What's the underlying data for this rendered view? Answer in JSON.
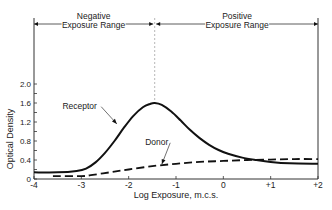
{
  "chart_data": {
    "type": "line",
    "title": "",
    "xlabel": "Log Exposure, m.c.s.",
    "ylabel": "Optical Density",
    "xlim": [
      -4,
      2
    ],
    "ylim": [
      0,
      2.0
    ],
    "grid": false,
    "x_ticks": [
      -4,
      -3,
      -2,
      -1,
      0,
      1,
      2
    ],
    "x_tick_labels": [
      "-4",
      "-3",
      "-2",
      "-1",
      "0",
      "+1",
      "+2"
    ],
    "y_ticks": [
      0,
      0.4,
      0.8,
      1.2,
      1.6,
      2.0
    ],
    "y_tick_labels": [
      "0",
      "0.4",
      "0.8",
      "1.2",
      "1.6",
      "2.0"
    ],
    "regions": [
      {
        "label_line1": "Negative",
        "label_line2": "Exposure Range",
        "x_start": -4,
        "x_end": -1.45
      },
      {
        "label_line1": "Positive",
        "label_line2": "Exposure Range",
        "x_start": -1.45,
        "x_end": 2
      }
    ],
    "divider_x": -1.45,
    "series": [
      {
        "name": "Receptor",
        "style": "solid",
        "x": [
          -4,
          -3.5,
          -3.1,
          -2.9,
          -2.7,
          -2.5,
          -2.3,
          -2.1,
          -1.9,
          -1.7,
          -1.55,
          -1.45,
          -1.3,
          -1.1,
          -0.9,
          -0.7,
          -0.5,
          -0.3,
          -0.1,
          0.1,
          0.4,
          0.7,
          1.0,
          1.4,
          2.0
        ],
        "y": [
          0.14,
          0.14,
          0.17,
          0.22,
          0.35,
          0.55,
          0.8,
          1.08,
          1.33,
          1.51,
          1.58,
          1.6,
          1.56,
          1.42,
          1.23,
          1.03,
          0.86,
          0.72,
          0.61,
          0.53,
          0.45,
          0.4,
          0.36,
          0.33,
          0.32
        ]
      },
      {
        "name": "Donor",
        "style": "dashed",
        "x": [
          -3.6,
          -3.0,
          -2.8,
          -2.4,
          -2.0,
          -1.5,
          -1.0,
          -0.5,
          0.0,
          0.5,
          1.0,
          1.5,
          2.0
        ],
        "y": [
          0.06,
          0.06,
          0.08,
          0.14,
          0.2,
          0.27,
          0.32,
          0.36,
          0.38,
          0.4,
          0.41,
          0.42,
          0.42
        ]
      }
    ],
    "annotations": [
      {
        "text": "Receptor",
        "text_x": -3.4,
        "text_y": 1.48,
        "arrow_to_x": -2.25,
        "arrow_to_y": 1.16
      },
      {
        "text": "Donor",
        "text_x": -1.65,
        "text_y": 0.72,
        "arrow_to_x": -1.3,
        "arrow_to_y": 0.31
      }
    ]
  },
  "colors": {
    "line": "#111111",
    "axis": "#333333",
    "divider": "#999999"
  }
}
